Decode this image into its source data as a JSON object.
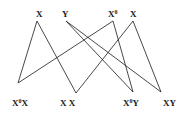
{
  "diagram": {
    "top_nodes": [
      {
        "id": "t1",
        "label": "X",
        "sup": "",
        "x": 37,
        "y": 21
      },
      {
        "id": "t2",
        "label": "Y",
        "sup": "",
        "x": 66,
        "y": 21
      },
      {
        "id": "t3",
        "label": "X",
        "sup": "0",
        "x": 113,
        "y": 21
      },
      {
        "id": "t4",
        "label": "X",
        "sup": "",
        "x": 133,
        "y": 21
      }
    ],
    "bottom_nodes": [
      {
        "id": "b1",
        "label_a": "X",
        "sup": "0",
        "label_b": "X",
        "x": 18,
        "y": 83
      },
      {
        "id": "b2",
        "label_a": "X X",
        "sup": "",
        "label_b": "",
        "x": 76,
        "y": 93
      },
      {
        "id": "b3",
        "label_a": "X",
        "sup": "0",
        "label_b": "Y",
        "x": 133,
        "y": 92
      },
      {
        "id": "b4",
        "label_a": "XY",
        "sup": "",
        "label_b": "",
        "x": 161,
        "y": 92
      }
    ],
    "edges": [
      [
        "t1",
        "b1"
      ],
      [
        "t1",
        "b2"
      ],
      [
        "t2",
        "b3"
      ],
      [
        "t2",
        "b4"
      ],
      [
        "t3",
        "b1"
      ],
      [
        "t3",
        "b3"
      ],
      [
        "t4",
        "b2"
      ],
      [
        "t4",
        "b4"
      ]
    ]
  }
}
